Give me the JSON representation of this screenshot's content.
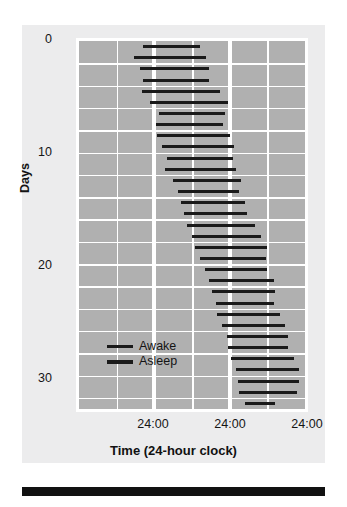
{
  "axes": {
    "ylabel": "Days",
    "xlabel": "Time (24-hour clock)",
    "yticks": [
      "0",
      "10",
      "20",
      "30"
    ],
    "xticks": [
      "24:00",
      "24:00",
      "24:00"
    ]
  },
  "legend": {
    "awake": "Awake",
    "asleep": "Asleep"
  },
  "colors": {
    "panel": "#ececed",
    "plot_background": "#b0b0b0",
    "grid": "#ffffff",
    "bar": "#1a1a1a",
    "text": "#151515",
    "footer_rule": "#111111"
  },
  "chart_data": {
    "type": "bar",
    "title": "",
    "subtitle": "",
    "xlabel": "Time (24-hour clock)",
    "ylabel": "Days",
    "xlim": [
      0,
      72
    ],
    "ylim": [
      0,
      33
    ],
    "xtick_values": [
      24,
      48,
      72
    ],
    "xtick_labels": [
      "24:00",
      "24:00",
      "24:00"
    ],
    "ytick_values": [
      0,
      10,
      20,
      30
    ],
    "ytick_labels": [
      "0",
      "10",
      "20",
      "30"
    ],
    "grid": true,
    "legend_position": "inside-lower-left",
    "legend_entries": [
      "Awake",
      "Asleep"
    ],
    "series": [
      {
        "name": "Asleep",
        "note": "Each horizontal black bar is one sleep episode, plotted on a 72-hour (triple-plot) time axis. start/end are hours from the left edge of the plot.",
        "bars": [
          {
            "day": 1,
            "start": 20.5,
            "end": 38.5
          },
          {
            "day": 2,
            "start": 17.5,
            "end": 40.5
          },
          {
            "day": 3,
            "start": 19.5,
            "end": 41.5
          },
          {
            "day": 4,
            "start": 20.5,
            "end": 41.5
          },
          {
            "day": 5,
            "start": 20.0,
            "end": 45.0
          },
          {
            "day": 6,
            "start": 22.5,
            "end": 47.5
          },
          {
            "day": 7,
            "start": 25.5,
            "end": 46.5
          },
          {
            "day": 8,
            "start": 24.5,
            "end": 46.0
          },
          {
            "day": 9,
            "start": 25.0,
            "end": 48.0
          },
          {
            "day": 10,
            "start": 26.5,
            "end": 49.5
          },
          {
            "day": 11,
            "start": 28.0,
            "end": 49.0
          },
          {
            "day": 12,
            "start": 27.5,
            "end": 50.0
          },
          {
            "day": 13,
            "start": 30.0,
            "end": 51.5
          },
          {
            "day": 14,
            "start": 31.5,
            "end": 51.0
          },
          {
            "day": 15,
            "start": 32.5,
            "end": 53.0
          },
          {
            "day": 16,
            "start": 33.5,
            "end": 53.5
          },
          {
            "day": 17,
            "start": 34.5,
            "end": 56.0
          },
          {
            "day": 18,
            "start": 36.0,
            "end": 58.0
          },
          {
            "day": 19,
            "start": 37.0,
            "end": 60.0
          },
          {
            "day": 20,
            "start": 38.5,
            "end": 59.5
          },
          {
            "day": 21,
            "start": 40.0,
            "end": 60.0
          },
          {
            "day": 22,
            "start": 41.5,
            "end": 62.0
          },
          {
            "day": 23,
            "start": 42.5,
            "end": 62.5
          },
          {
            "day": 24,
            "start": 43.5,
            "end": 62.0
          },
          {
            "day": 25,
            "start": 44.0,
            "end": 64.0
          },
          {
            "day": 26,
            "start": 45.5,
            "end": 65.5
          },
          {
            "day": 27,
            "start": 47.0,
            "end": 66.5
          },
          {
            "day": 28,
            "start": 47.5,
            "end": 66.5
          },
          {
            "day": 29,
            "start": 48.5,
            "end": 68.5
          },
          {
            "day": 30,
            "start": 50.0,
            "end": 70.0
          },
          {
            "day": 31,
            "start": 50.5,
            "end": 70.0
          },
          {
            "day": 32,
            "start": 51.0,
            "end": 69.5
          },
          {
            "day": 33,
            "start": 53.0,
            "end": 62.5
          }
        ]
      }
    ]
  },
  "grid_spec": {
    "rows": 33,
    "minor_columns_at": [
      12,
      36,
      60
    ],
    "major_columns_at": [
      24,
      48
    ],
    "hline_every": 2
  }
}
